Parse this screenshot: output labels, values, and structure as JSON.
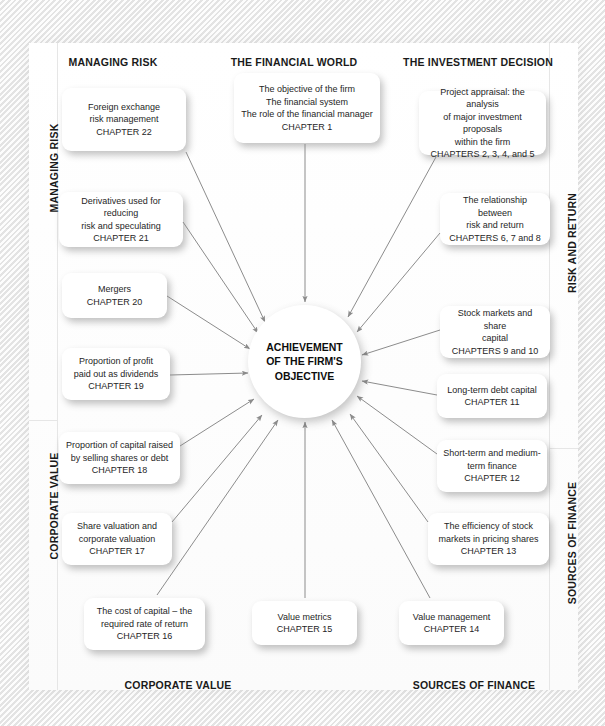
{
  "diagram": {
    "hub": {
      "label": "ACHIEVEMENT\nOF THE FIRM'S\nOBJECTIVE"
    },
    "colors": {
      "background": "#f2f2f2",
      "panel": "#ffffff",
      "node_fill": "#ffffff",
      "arrow": "#8c8c8c",
      "text": "#262626",
      "heading_text": "#1a1a1a"
    },
    "column_headings": [
      {
        "id": "managing-risk",
        "label": "MANAGING RISK",
        "x": 113,
        "y": 56
      },
      {
        "id": "the-financial-world",
        "label": "THE FINANCIAL WORLD",
        "x": 294,
        "y": 56
      },
      {
        "id": "the-investment-decision",
        "label": "THE INVESTMENT DECISION",
        "x": 478,
        "y": 56
      }
    ],
    "bottom_headings": [
      {
        "id": "corporate-value",
        "label": "CORPORATE VALUE",
        "x": 178,
        "y": 679
      },
      {
        "id": "sources-of-finance",
        "label": "SOURCES OF FINANCE",
        "x": 474,
        "y": 679
      }
    ],
    "side_headings": [
      {
        "id": "managing-risk-side",
        "label": "MANAGING RISK",
        "side": "left",
        "x": 48,
        "y": 168
      },
      {
        "id": "corporate-value-side",
        "label": "CORPORATE VALUE",
        "side": "left",
        "x": 48,
        "y": 506
      },
      {
        "id": "risk-and-return-side",
        "label": "RISK AND RETURN",
        "side": "right",
        "x": 566,
        "y": 243
      },
      {
        "id": "sources-of-finance-side",
        "label": "SOURCES OF FINANCE",
        "side": "right",
        "x": 566,
        "y": 543
      }
    ],
    "nodes": [
      {
        "id": "chapter-22",
        "label": "Foreign exchange\nrisk management\nCHAPTER 22",
        "x": 62,
        "y": 88,
        "w": 124,
        "h": 63
      },
      {
        "id": "chapter-1",
        "label": "The objective of the firm\nThe financial system\nThe role of the financial manager\nCHAPTER 1",
        "x": 234,
        "y": 73,
        "w": 146,
        "h": 70
      },
      {
        "id": "chapter-2-5",
        "label": "Project appraisal: the analysis\nof major investment proposals\nwithin the firm\nCHAPTERS 2, 3, 4, and 5",
        "x": 419,
        "y": 91,
        "w": 127,
        "h": 64
      },
      {
        "id": "chapter-21",
        "label": "Derivatives used for reducing\nrisk and speculating\nCHAPTER 21",
        "x": 59,
        "y": 192,
        "w": 124,
        "h": 55
      },
      {
        "id": "chapter-6-8",
        "label": "The relationship between\nrisk and return\nCHAPTERS 6, 7 and 8",
        "x": 440,
        "y": 193,
        "w": 110,
        "h": 52
      },
      {
        "id": "chapter-20",
        "label": "Mergers\nCHAPTER 20",
        "x": 62,
        "y": 273,
        "w": 105,
        "h": 45
      },
      {
        "id": "chapter-9-10",
        "label": "Stock markets and share\ncapital\nCHAPTERS 9 and 10",
        "x": 440,
        "y": 306,
        "w": 110,
        "h": 52
      },
      {
        "id": "chapter-19",
        "label": "Proportion of profit\npaid out as dividends\nCHAPTER 19",
        "x": 62,
        "y": 348,
        "w": 108,
        "h": 52
      },
      {
        "id": "chapter-11",
        "label": "Long-term debt capital\nCHAPTER 11",
        "x": 437,
        "y": 374,
        "w": 110,
        "h": 44
      },
      {
        "id": "chapter-18",
        "label": "Proportion of capital raised\nby selling shares or debt\nCHAPTER 18",
        "x": 59,
        "y": 432,
        "w": 121,
        "h": 52
      },
      {
        "id": "chapter-12",
        "label": "Short-term and medium-\nterm finance\nCHAPTER 12",
        "x": 437,
        "y": 440,
        "w": 110,
        "h": 52
      },
      {
        "id": "chapter-17",
        "label": "Share valuation and\ncorporate valuation\nCHAPTER 17",
        "x": 62,
        "y": 513,
        "w": 110,
        "h": 52
      },
      {
        "id": "chapter-13",
        "label": "The efficiency of stock\nmarkets in pricing shares\nCHAPTER 13",
        "x": 428,
        "y": 513,
        "w": 121,
        "h": 52
      },
      {
        "id": "chapter-16",
        "label": "The cost of capital – the\nrequired rate of return\nCHAPTER 16",
        "x": 84,
        "y": 598,
        "w": 121,
        "h": 52
      },
      {
        "id": "chapter-15",
        "label": "Value metrics\nCHAPTER 15",
        "x": 252,
        "y": 601,
        "w": 105,
        "h": 44
      },
      {
        "id": "chapter-14",
        "label": "Value management\nCHAPTER 14",
        "x": 399,
        "y": 601,
        "w": 105,
        "h": 44
      }
    ],
    "arrows": [
      {
        "id": "arrow-from-chapter-22",
        "x1": 186,
        "y1": 152,
        "x2": 265,
        "y2": 322
      },
      {
        "id": "arrow-from-chapter-1",
        "x1": 305,
        "y1": 144,
        "x2": 305,
        "y2": 302
      },
      {
        "id": "arrow-from-chapter-2-5",
        "x1": 436,
        "y1": 157,
        "x2": 348,
        "y2": 317
      },
      {
        "id": "arrow-from-chapter-21",
        "x1": 183,
        "y1": 222,
        "x2": 258,
        "y2": 333
      },
      {
        "id": "arrow-from-chapter-6-8",
        "x1": 440,
        "y1": 233,
        "x2": 357,
        "y2": 332
      },
      {
        "id": "arrow-from-chapter-20",
        "x1": 167,
        "y1": 296,
        "x2": 250,
        "y2": 349
      },
      {
        "id": "arrow-from-chapter-9-10",
        "x1": 440,
        "y1": 330,
        "x2": 362,
        "y2": 355
      },
      {
        "id": "arrow-from-chapter-19",
        "x1": 170,
        "y1": 375,
        "x2": 248,
        "y2": 373
      },
      {
        "id": "arrow-from-chapter-11",
        "x1": 437,
        "y1": 395,
        "x2": 362,
        "y2": 381
      },
      {
        "id": "arrow-from-chapter-18",
        "x1": 180,
        "y1": 446,
        "x2": 254,
        "y2": 399
      },
      {
        "id": "arrow-from-chapter-12",
        "x1": 437,
        "y1": 454,
        "x2": 357,
        "y2": 396
      },
      {
        "id": "arrow-from-chapter-17",
        "x1": 172,
        "y1": 522,
        "x2": 262,
        "y2": 415
      },
      {
        "id": "arrow-from-chapter-13",
        "x1": 428,
        "y1": 522,
        "x2": 350,
        "y2": 414
      },
      {
        "id": "arrow-from-chapter-16",
        "x1": 157,
        "y1": 595,
        "x2": 278,
        "y2": 420
      },
      {
        "id": "arrow-from-chapter-15",
        "x1": 305,
        "y1": 598,
        "x2": 305,
        "y2": 422
      },
      {
        "id": "arrow-from-chapter-14",
        "x1": 430,
        "y1": 598,
        "x2": 332,
        "y2": 420
      }
    ]
  }
}
